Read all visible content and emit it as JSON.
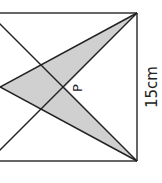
{
  "diagram": {
    "type": "geometry",
    "shape": "square",
    "point_label": "P",
    "side_label": "15cm",
    "colors": {
      "stroke": "#2a2a2a",
      "fill": "#cfcfcf",
      "background": "#ffffff"
    }
  }
}
